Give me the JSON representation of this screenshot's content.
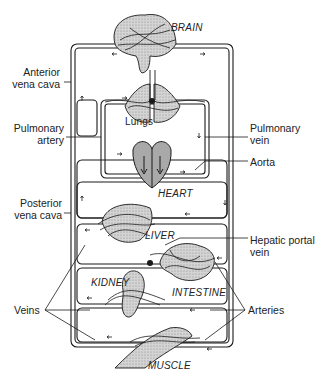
{
  "diagram": {
    "type": "circulatory-system-schematic",
    "colors": {
      "line": "#1a1a1a",
      "organ_fill": "#cfcfcf",
      "heart_fill": "#a9a9a9",
      "background": "#ffffff"
    },
    "organs": {
      "brain": "BRAIN",
      "lungs": "Lungs",
      "heart": "HEART",
      "liver": "LIVER",
      "kidney": "KIDNEY",
      "intestine": "INTESTINE",
      "muscle": "MUSCLE"
    },
    "labels": {
      "anterior_vena_cava_1": "Anterior",
      "anterior_vena_cava_2": "vena cava",
      "pulmonary_artery_1": "Pulmonary",
      "pulmonary_artery_2": "artery",
      "pulmonary_vein_1": "Pulmonary",
      "pulmonary_vein_2": "vein",
      "aorta": "Aorta",
      "posterior_vena_cava_1": "Posterior",
      "posterior_vena_cava_2": "vena cava",
      "hepatic_portal_vein_1": "Hepatic portal",
      "hepatic_portal_vein_2": "vein",
      "veins": "Veins",
      "arteries": "Arteries"
    }
  }
}
